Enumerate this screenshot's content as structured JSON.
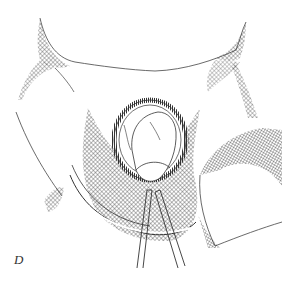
{
  "figure": {
    "panel_label": "D",
    "colors": {
      "ink": "#2a2a2a",
      "background": "#ffffff"
    }
  }
}
